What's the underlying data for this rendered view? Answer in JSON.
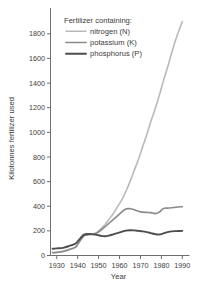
{
  "chart_data": {
    "type": "line",
    "title": "",
    "xlabel": "Year",
    "ylabel": "Kilotonnes fertilizer used",
    "xlim": [
      1927,
      1992
    ],
    "ylim": [
      0,
      1900
    ],
    "grid": false,
    "legend_position": "top-center",
    "legend_title": "Fertilizer containing:",
    "x_ticks": [
      1930,
      1940,
      1950,
      1960,
      1970,
      1980,
      1990
    ],
    "x_tick_labels": [
      "1930",
      "1940",
      "1950",
      "1960",
      "1970",
      "1980",
      "1990"
    ],
    "y_ticks": [
      0,
      200,
      400,
      600,
      800,
      1000,
      1200,
      1400,
      1600,
      1800
    ],
    "y_tick_labels": [
      "0",
      "200",
      "400",
      "600",
      "800",
      "1000",
      "1200",
      "1400",
      "1600",
      "1800"
    ],
    "x": [
      1928,
      1930,
      1933,
      1936,
      1939,
      1941,
      1943,
      1945,
      1947,
      1949,
      1951,
      1953,
      1955,
      1957,
      1959,
      1961,
      1963,
      1965,
      1967,
      1969,
      1971,
      1973,
      1975,
      1977,
      1979,
      1981,
      1983,
      1985,
      1987,
      1990
    ],
    "series": [
      {
        "name": "nitrogen (N)",
        "color": "#b9b9b9",
        "values": [
          25,
          28,
          35,
          50,
          70,
          120,
          165,
          170,
          175,
          185,
          215,
          250,
          295,
          340,
          395,
          450,
          520,
          600,
          690,
          780,
          880,
          980,
          1090,
          1190,
          1300,
          1420,
          1530,
          1650,
          1760,
          1900
        ]
      },
      {
        "name": "potassium (K)",
        "color": "#8a8a8a",
        "values": [
          22,
          25,
          32,
          48,
          68,
          115,
          160,
          168,
          172,
          180,
          205,
          232,
          262,
          292,
          322,
          352,
          378,
          380,
          372,
          360,
          352,
          350,
          348,
          340,
          352,
          382,
          385,
          388,
          392,
          396
        ]
      },
      {
        "name": "phosphorus (P)",
        "color": "#4d4d4d",
        "values": [
          55,
          58,
          62,
          78,
          98,
          135,
          170,
          175,
          172,
          168,
          160,
          156,
          162,
          172,
          182,
          192,
          202,
          205,
          204,
          200,
          196,
          190,
          182,
          174,
          170,
          180,
          190,
          196,
          198,
          200
        ]
      }
    ]
  }
}
